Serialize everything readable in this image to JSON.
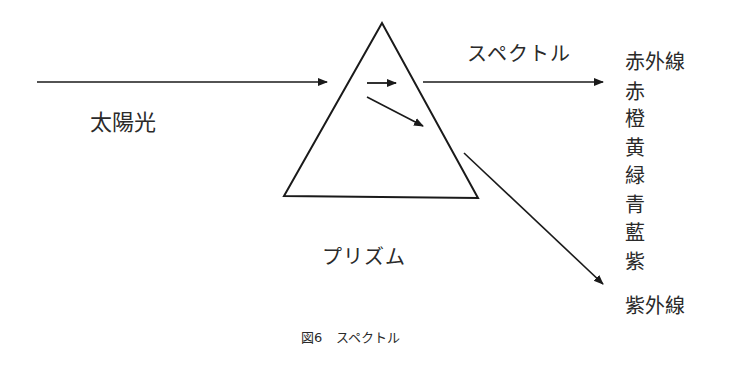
{
  "diagram": {
    "type": "prism-dispersion",
    "labels": {
      "sunlight": "太陽光",
      "spectrum": "スペクトル",
      "prism": "プリズム"
    },
    "caption": {
      "figure_number": "図6",
      "title": "スペクトル"
    },
    "spectrum_colors": [
      {
        "label": "赤外線",
        "top": 0
      },
      {
        "label": "赤",
        "top": 30
      },
      {
        "label": "橙",
        "top": 57
      },
      {
        "label": "黄",
        "top": 86
      },
      {
        "label": "緑",
        "top": 114
      },
      {
        "label": "青",
        "top": 143
      },
      {
        "label": "藍",
        "top": 171
      },
      {
        "label": "紫",
        "top": 200
      },
      {
        "label": "紫外線",
        "top": 244
      }
    ],
    "line_color": "#1a1a1a"
  }
}
